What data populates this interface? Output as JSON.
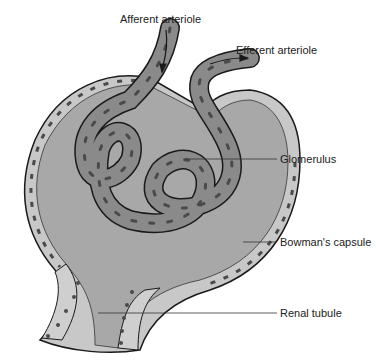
{
  "diagram": {
    "type": "anatomical-illustration",
    "labels": {
      "afferent": "Afferent arteriole",
      "efferent": "Efferent arteriole",
      "glomerulus": "Glomerulus",
      "bowman": "Bowman's capsule",
      "tubule": "Renal tubule"
    },
    "colors": {
      "background": "#ffffff",
      "capsule_space": "#a8a8a8",
      "capsule_wall": "#c8c8c8",
      "capillary": "#8a8a8a",
      "nuclei": "#4a4a4a",
      "outline": "#1a1a1a",
      "tubule_cells": "#cfcfcf",
      "leader_line": "#333333"
    }
  }
}
